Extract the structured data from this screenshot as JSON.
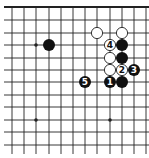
{
  "diagram": {
    "type": "go-board-fragment",
    "grid": {
      "x_lines": [
        12,
        24,
        36,
        49,
        61,
        73,
        85,
        97,
        110,
        122,
        134,
        146
      ],
      "y_lines": [
        7,
        20,
        33,
        45,
        58,
        70,
        82,
        95,
        107,
        120,
        132,
        145
      ],
      "top_edge": true,
      "line_color": "#222222"
    },
    "star_points": [
      {
        "x": 36,
        "y": 45
      },
      {
        "x": 36,
        "y": 120
      },
      {
        "x": 110,
        "y": 120
      }
    ],
    "stones": [
      {
        "color": "black",
        "x": 49,
        "y": 45,
        "label": ""
      },
      {
        "color": "white",
        "x": 97,
        "y": 33,
        "label": ""
      },
      {
        "color": "white",
        "x": 122,
        "y": 33,
        "label": ""
      },
      {
        "color": "white",
        "x": 110,
        "y": 45,
        "label": "4"
      },
      {
        "color": "black",
        "x": 122,
        "y": 45,
        "label": ""
      },
      {
        "color": "white",
        "x": 110,
        "y": 58,
        "label": ""
      },
      {
        "color": "black",
        "x": 122,
        "y": 58,
        "label": ""
      },
      {
        "color": "white",
        "x": 110,
        "y": 70,
        "label": ""
      },
      {
        "color": "white",
        "x": 122,
        "y": 70,
        "label": "2"
      },
      {
        "color": "black",
        "x": 134,
        "y": 70,
        "label": "3"
      },
      {
        "color": "black",
        "x": 85,
        "y": 82,
        "label": "5"
      },
      {
        "color": "black",
        "x": 110,
        "y": 82,
        "label": "1"
      },
      {
        "color": "black",
        "x": 122,
        "y": 82,
        "label": ""
      }
    ],
    "colors": {
      "black_stone": "#111111",
      "white_stone": "#ffffff",
      "white_outline": "#222222"
    }
  }
}
